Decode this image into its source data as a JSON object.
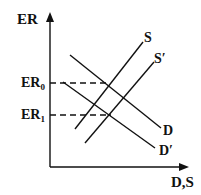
{
  "labels": {
    "y_axis": "ER",
    "x_axis": "D,S",
    "er0_base": "ER",
    "er0_sub": "0",
    "er1_base": "ER",
    "er1_sub": "1",
    "s": "S",
    "s_prime": "S′",
    "d": "D",
    "d_prime": "D′"
  },
  "colors": {
    "line": "#111111",
    "background": "#ffffff"
  }
}
